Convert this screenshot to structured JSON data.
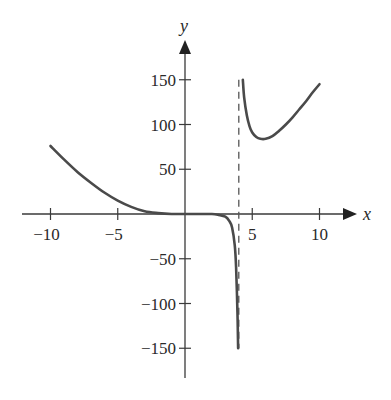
{
  "chart_data": {
    "type": "line",
    "title": "",
    "xlabel": "x",
    "ylabel": "y",
    "xlim": [
      -12,
      13
    ],
    "ylim": [
      -180,
      185
    ],
    "grid": false,
    "legend": null,
    "x_ticks": [
      -10,
      -5,
      5,
      10
    ],
    "x_tick_labels": [
      "−10",
      "−5",
      "5",
      "10"
    ],
    "y_ticks": [
      150,
      100,
      50,
      -50,
      -100,
      -150
    ],
    "y_tick_labels": [
      "150",
      "100",
      "50",
      "−50",
      "−100",
      "−150"
    ],
    "annotations": [
      {
        "type": "vertical-asymptote",
        "x": 4,
        "style": "dashed"
      }
    ],
    "series": [
      {
        "name": "left branch",
        "x": [
          -10,
          -9,
          -8,
          -7,
          -6,
          -5,
          -4,
          -3,
          -2,
          -1,
          0,
          1,
          2,
          2.5,
          3,
          3.3,
          3.5,
          3.7,
          3.8,
          3.9,
          3.95
        ],
        "y": [
          76,
          61,
          47,
          35,
          24,
          15,
          8,
          3,
          1,
          0,
          0,
          0,
          0,
          -1,
          -3,
          -8,
          -15,
          -35,
          -60,
          -110,
          -150
        ]
      },
      {
        "name": "right branch",
        "x": [
          4.3,
          4.4,
          4.6,
          4.8,
          5,
          5.3,
          5.6,
          6,
          6.5,
          7,
          7.5,
          8,
          8.5,
          9,
          9.5,
          10
        ],
        "y": [
          150,
          130,
          110,
          98,
          91,
          86,
          84,
          84,
          87,
          93,
          100,
          108,
          117,
          126,
          136,
          145
        ]
      }
    ]
  }
}
